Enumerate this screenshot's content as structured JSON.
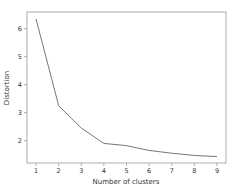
{
  "chart_data": {
    "type": "line",
    "title": "",
    "xlabel": "Number of clusters",
    "ylabel": "Distortion",
    "x": [
      1,
      2,
      3,
      4,
      5,
      6,
      7,
      8,
      9
    ],
    "series": [
      {
        "name": "distortion",
        "values": [
          6.35,
          3.25,
          2.45,
          1.9,
          1.82,
          1.65,
          1.55,
          1.47,
          1.43
        ],
        "color": "#777777"
      }
    ],
    "xticks": [
      "1",
      "2",
      "3",
      "4",
      "5",
      "6",
      "7",
      "8",
      "9"
    ],
    "yticks": [
      "2",
      "3",
      "4",
      "5",
      "6"
    ],
    "xlim": [
      0.6,
      9.4
    ],
    "ylim": [
      1.2,
      6.6
    ],
    "grid": false,
    "legend": null
  }
}
